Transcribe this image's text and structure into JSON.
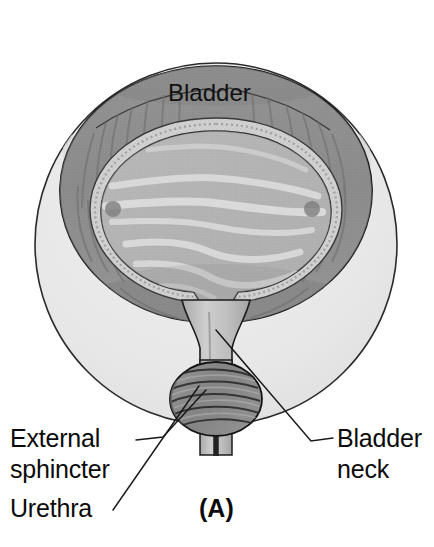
{
  "figure": {
    "panel_label": "(A)",
    "title_label": "Bladder",
    "background_color": "#ffffff",
    "outline_color": "#1a1a1a"
  },
  "labels": [
    {
      "id": "bladder",
      "text": "Bladder",
      "x": 168,
      "y": 101,
      "anchor": "start",
      "has_leader": false
    },
    {
      "id": "external-sphincter",
      "text_line1": "External",
      "text_line2": "sphincter",
      "x": 10,
      "y": 447,
      "anchor": "start",
      "has_leader": true,
      "leader": "M 136 440 L 163 437 L 206 390"
    },
    {
      "id": "urethra",
      "text": "Urethra",
      "x": 10,
      "y": 517,
      "anchor": "start",
      "has_leader": true,
      "leader": "M 113 510 L 199 386"
    },
    {
      "id": "bladder-neck",
      "text_line1": "Bladder",
      "text_line2": "neck",
      "x": 337,
      "y": 447,
      "anchor": "start",
      "has_leader": true,
      "leader": "M 333 438 L 311 441 L 216 330"
    }
  ],
  "anatomy": {
    "outer_circle": {
      "cx": 216,
      "cy": 244,
      "r": 181,
      "fill": "#e9e9e9",
      "stroke": "#2b2b2b"
    },
    "detrusor": {
      "name": "detrusor-muscle-layer",
      "fill": "#8d8d8d",
      "stroke": "#1c1c1c",
      "description": "outer bladder wall with radiating muscle striations"
    },
    "submucosa": {
      "name": "submucosal-band",
      "fill": "#cdcdcd",
      "description": "stippled light band between detrusor and mucosa"
    },
    "mucosa": {
      "name": "bladder-mucosa-lumen",
      "fill": "#b4b4b4",
      "description": "inner bladder cavity with trigone folds"
    },
    "trigone_folds_color": "#dcdcdc",
    "ureteral_orifices": [
      {
        "id": "left-ureteral-orifice",
        "cx": 113,
        "cy": 209,
        "r": 8
      },
      {
        "id": "right-ureteral-orifice",
        "cx": 312,
        "cy": 209,
        "r": 8
      }
    ],
    "bladder_neck": {
      "name": "bladder-neck-funnel",
      "description": "funnel narrowing from bladder base into urethra"
    },
    "urethra": {
      "name": "urethra-tube",
      "fill": "#bdbdbd",
      "lumen_color": "#2a2a2a"
    },
    "external_sphincter": {
      "name": "external-sphincter-collar",
      "fill": "#8a8a8a",
      "stroke": "#1c1c1c",
      "description": "striated muscle collar encircling the urethra, drawn as banded knot"
    }
  }
}
